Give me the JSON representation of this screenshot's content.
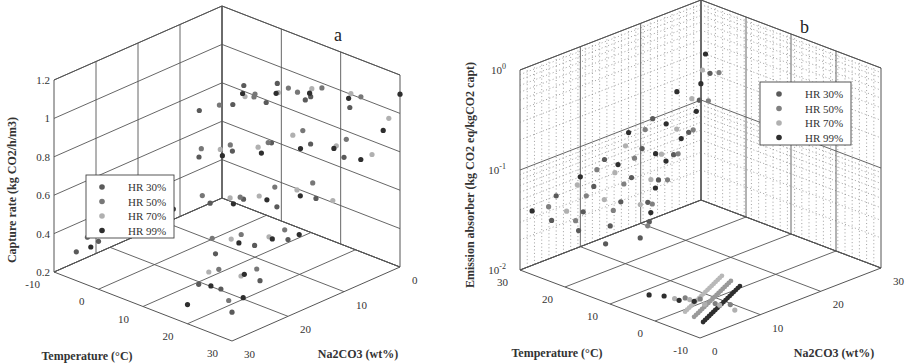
{
  "chart_data": [
    {
      "panel": "a",
      "type": "scatter3d",
      "title": "",
      "panel_label": "a",
      "xlabel": "Temperature (°C)",
      "ylabel": "Na2CO3 (wt%)",
      "zlabel": "Capture rate (kg CO2/h/m3)",
      "x_ticks": [
        "-10",
        "0",
        "10",
        "20",
        "30"
      ],
      "y_ticks": [
        "0",
        "10",
        "20",
        "30"
      ],
      "z_ticks": [
        "0.2",
        "0.4",
        "0.6",
        "0.8",
        "1",
        "1.2"
      ],
      "xlim": [
        -10,
        30
      ],
      "ylim": [
        0,
        30
      ],
      "zlim": [
        0.2,
        1.2
      ],
      "grid": true,
      "legend_position": "left-middle",
      "legend": [
        "HR 30%",
        "HR 50%",
        "HR 70%",
        "HR 99%"
      ],
      "series": [
        {
          "name": "HR 30%",
          "color": "#5a5a5a",
          "points": [
            [
              25,
              5,
              1.05
            ],
            [
              20,
              8,
              1.1
            ],
            [
              15,
              10,
              1.15
            ],
            [
              10,
              12,
              1.12
            ],
            [
              30,
              10,
              0.9
            ],
            [
              25,
              12,
              0.95
            ],
            [
              20,
              15,
              0.95
            ],
            [
              15,
              18,
              0.9
            ],
            [
              10,
              20,
              0.85
            ],
            [
              30,
              15,
              0.75
            ],
            [
              25,
              18,
              0.7
            ],
            [
              20,
              20,
              0.72
            ],
            [
              15,
              22,
              0.68
            ],
            [
              30,
              20,
              0.6
            ],
            [
              25,
              22,
              0.55
            ],
            [
              20,
              25,
              0.5
            ],
            [
              30,
              25,
              0.45
            ],
            [
              25,
              28,
              0.4
            ],
            [
              30,
              30,
              0.35
            ],
            [
              20,
              28,
              0.38
            ],
            [
              10,
              25,
              0.65
            ],
            [
              5,
              28,
              0.55
            ],
            [
              0,
              30,
              0.45
            ],
            [
              -5,
              30,
              0.35
            ],
            [
              15,
              5,
              1.0
            ],
            [
              10,
              8,
              0.98
            ],
            [
              5,
              10,
              0.95
            ],
            [
              0,
              12,
              0.9
            ]
          ]
        },
        {
          "name": "HR 50%",
          "color": "#777777",
          "points": [
            [
              25,
              3,
              1.08
            ],
            [
              20,
              6,
              1.12
            ],
            [
              15,
              8,
              1.1
            ],
            [
              10,
              10,
              1.05
            ],
            [
              28,
              8,
              0.95
            ],
            [
              22,
              11,
              0.98
            ],
            [
              18,
              14,
              0.92
            ],
            [
              12,
              16,
              0.88
            ],
            [
              8,
              18,
              0.85
            ],
            [
              28,
              14,
              0.8
            ],
            [
              22,
              16,
              0.75
            ],
            [
              18,
              19,
              0.7
            ],
            [
              12,
              21,
              0.68
            ],
            [
              28,
              19,
              0.62
            ],
            [
              22,
              22,
              0.58
            ],
            [
              18,
              24,
              0.55
            ],
            [
              28,
              24,
              0.48
            ],
            [
              22,
              26,
              0.45
            ],
            [
              28,
              29,
              0.38
            ],
            [
              5,
              22,
              0.62
            ],
            [
              0,
              26,
              0.5
            ],
            [
              -5,
              28,
              0.4
            ],
            [
              12,
              4,
              1.0
            ],
            [
              6,
              7,
              0.96
            ],
            [
              2,
              10,
              0.92
            ]
          ]
        },
        {
          "name": "HR 70%",
          "color": "#b0b0b0",
          "points": [
            [
              24,
              4,
              1.1
            ],
            [
              19,
              7,
              1.12
            ],
            [
              14,
              9,
              1.08
            ],
            [
              9,
              11,
              1.04
            ],
            [
              27,
              9,
              0.92
            ],
            [
              21,
              12,
              0.96
            ],
            [
              17,
              15,
              0.9
            ],
            [
              11,
              17,
              0.86
            ],
            [
              27,
              16,
              0.78
            ],
            [
              21,
              18,
              0.72
            ],
            [
              17,
              20,
              0.7
            ],
            [
              27,
              21,
              0.6
            ],
            [
              21,
              23,
              0.56
            ],
            [
              27,
              26,
              0.46
            ],
            [
              21,
              27,
              0.44
            ],
            [
              3,
              24,
              0.58
            ],
            [
              -2,
              27,
              0.46
            ],
            [
              30,
              2,
              1.0
            ],
            [
              30,
              5,
              0.85
            ],
            [
              30,
              12,
              0.7
            ]
          ]
        },
        {
          "name": "HR 99%",
          "color": "#2e2e2e",
          "points": [
            [
              26,
              6,
              1.12
            ],
            [
              21,
              9,
              1.14
            ],
            [
              16,
              11,
              1.12
            ],
            [
              11,
              13,
              1.1
            ],
            [
              29,
              11,
              0.95
            ],
            [
              24,
              13,
              0.93
            ],
            [
              19,
              16,
              0.9
            ],
            [
              14,
              19,
              0.88
            ],
            [
              29,
              17,
              0.78
            ],
            [
              24,
              19,
              0.74
            ],
            [
              19,
              21,
              0.7
            ],
            [
              29,
              22,
              0.62
            ],
            [
              24,
              24,
              0.58
            ],
            [
              29,
              27,
              0.5
            ],
            [
              24,
              29,
              0.42
            ],
            [
              30,
              0,
              1.1
            ],
            [
              30,
              3,
              0.95
            ],
            [
              30,
              7,
              0.85
            ],
            [
              30,
              18,
              0.6
            ],
            [
              30,
              28,
              0.4
            ],
            [
              8,
              23,
              0.6
            ],
            [
              2,
              27,
              0.5
            ],
            [
              -3,
              29,
              0.38
            ],
            [
              20,
              30,
              0.3
            ]
          ]
        }
      ]
    },
    {
      "panel": "b",
      "type": "scatter3d",
      "title": "",
      "panel_label": "b",
      "xlabel": "Temperature (°C)",
      "ylabel": "Na2CO3 (wt%)",
      "zlabel": "Emission absorber (kg CO2 eq/kgCO2 capt)",
      "x_ticks": [
        "30",
        "20",
        "10",
        "0",
        "-10"
      ],
      "y_ticks": [
        "0",
        "10",
        "20",
        "30"
      ],
      "z_ticks": [
        "10^-2",
        "10^-1",
        "10^0"
      ],
      "xlim": [
        -10,
        30
      ],
      "ylim": [
        0,
        30
      ],
      "zlim": [
        0.01,
        1
      ],
      "zscale": "log",
      "grid": true,
      "legend_position": "upper-right",
      "legend": [
        "HR 30%",
        "HR 50%",
        "HR 70%",
        "HR 99%"
      ],
      "series": [
        {
          "name": "HR 30%",
          "color": "#5a5a5a",
          "points": [
            [
              28,
              30,
              0.2
            ],
            [
              25,
              26,
              0.15
            ],
            [
              22,
              22,
              0.1
            ],
            [
              20,
              18,
              0.08
            ],
            [
              18,
              14,
              0.06
            ],
            [
              15,
              10,
              0.05
            ],
            [
              12,
              8,
              0.04
            ],
            [
              10,
              5,
              0.035
            ],
            [
              30,
              22,
              0.1
            ],
            [
              27,
              18,
              0.07
            ],
            [
              24,
              14,
              0.05
            ],
            [
              21,
              10,
              0.04
            ],
            [
              18,
              6,
              0.032
            ],
            [
              15,
              3,
              0.028
            ],
            [
              30,
              14,
              0.06
            ],
            [
              27,
              10,
              0.045
            ],
            [
              24,
              6,
              0.035
            ],
            [
              21,
              3,
              0.03
            ],
            [
              30,
              6,
              0.04
            ],
            [
              27,
              3,
              0.03
            ]
          ]
        },
        {
          "name": "HR 50%",
          "color": "#808080",
          "points": [
            [
              26,
              30,
              0.22
            ],
            [
              23,
              26,
              0.16
            ],
            [
              21,
              22,
              0.11
            ],
            [
              19,
              18,
              0.085
            ],
            [
              16,
              14,
              0.065
            ],
            [
              14,
              10,
              0.05
            ],
            [
              11,
              7,
              0.04
            ],
            [
              29,
              20,
              0.09
            ],
            [
              26,
              16,
              0.065
            ],
            [
              23,
              12,
              0.05
            ],
            [
              20,
              8,
              0.038
            ],
            [
              29,
              12,
              0.055
            ],
            [
              26,
              8,
              0.042
            ],
            [
              23,
              4,
              0.033
            ],
            [
              29,
              4,
              0.036
            ],
            [
              0,
              5,
              0.013
            ],
            [
              -2,
              6,
              0.013
            ],
            [
              -4,
              7,
              0.012
            ],
            [
              -6,
              8,
              0.012
            ]
          ]
        },
        {
          "name": "HR 70%",
          "color": "#b0b0b0",
          "points": [
            [
              27,
              28,
              0.25
            ],
            [
              24,
              24,
              0.18
            ],
            [
              22,
              20,
              0.12
            ],
            [
              20,
              16,
              0.09
            ],
            [
              17,
              12,
              0.07
            ],
            [
              14,
              8,
              0.055
            ],
            [
              28,
              16,
              0.08
            ],
            [
              25,
              12,
              0.06
            ],
            [
              22,
              8,
              0.045
            ],
            [
              28,
              8,
              0.05
            ],
            [
              25,
              4,
              0.038
            ],
            [
              1,
              4,
              0.013
            ],
            [
              -1,
              5,
              0.013
            ],
            [
              -3,
              6,
              0.012
            ],
            [
              -5,
              7,
              0.012
            ],
            [
              -7,
              8,
              0.011
            ]
          ]
        },
        {
          "name": "HR 99%",
          "color": "#2e2e2e",
          "points": [
            [
              29,
              30,
              0.3
            ],
            [
              26,
              27,
              0.2
            ],
            [
              23,
              24,
              0.14
            ],
            [
              21,
              20,
              0.1
            ],
            [
              19,
              16,
              0.08
            ],
            [
              16,
              12,
              0.06
            ],
            [
              13,
              9,
              0.045
            ],
            [
              30,
              26,
              0.15
            ],
            [
              30,
              18,
              0.09
            ],
            [
              30,
              10,
              0.05
            ],
            [
              30,
              2,
              0.035
            ],
            [
              27,
              22,
              0.1
            ],
            [
              27,
              14,
              0.06
            ],
            [
              24,
              18,
              0.07
            ],
            [
              2,
              3,
              0.014
            ],
            [
              0,
              4,
              0.013
            ],
            [
              -2,
              5,
              0.013
            ],
            [
              4,
              2,
              0.014
            ]
          ]
        }
      ]
    }
  ]
}
